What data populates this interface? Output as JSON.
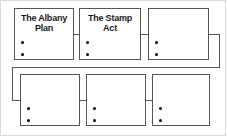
{
  "diagram": {
    "type": "flowchart",
    "title": "",
    "layout": "two-row-serpentine",
    "row_count": 2,
    "nodes_per_row": 3,
    "nodes": [
      {
        "id": "node-1",
        "label": "The Albany Plan",
        "title_line_1": "The Albany",
        "title_line_2": "Plan",
        "bullets": [
          "",
          ""
        ],
        "bullet_count": 2,
        "row": 1,
        "column": 1,
        "filled": true
      },
      {
        "id": "node-2",
        "label": "The Stamp Act",
        "title_line_1": "The Stamp",
        "title_line_2": "Act",
        "bullets": [
          "",
          ""
        ],
        "bullet_count": 2,
        "row": 1,
        "column": 2,
        "filled": true
      },
      {
        "id": "node-3",
        "label": "",
        "title_line_1": "",
        "title_line_2": "",
        "bullets": [
          "",
          ""
        ],
        "bullet_count": 2,
        "row": 1,
        "column": 3,
        "filled": false
      },
      {
        "id": "node-4",
        "label": "",
        "title_line_1": "",
        "title_line_2": "",
        "bullets": [
          "",
          ""
        ],
        "bullet_count": 2,
        "row": 2,
        "column": 1,
        "filled": false
      },
      {
        "id": "node-5",
        "label": "",
        "title_line_1": "",
        "title_line_2": "",
        "bullets": [
          "",
          ""
        ],
        "bullet_count": 2,
        "row": 2,
        "column": 2,
        "filled": false
      },
      {
        "id": "node-6",
        "label": "",
        "title_line_1": "",
        "title_line_2": "",
        "bullets": [
          "",
          ""
        ],
        "bullet_count": 2,
        "row": 2,
        "column": 3,
        "filled": false
      }
    ],
    "connectors": [
      {
        "id": "connector-1-2",
        "from": "node-1",
        "to": "node-2",
        "style": "straight-horizontal"
      },
      {
        "id": "connector-2-3",
        "from": "node-2",
        "to": "node-3",
        "style": "straight-horizontal"
      },
      {
        "id": "connector-3-4",
        "from": "node-3",
        "to": "node-4",
        "style": "wrap-around"
      },
      {
        "id": "connector-4-5",
        "from": "node-4",
        "to": "node-5",
        "style": "straight-horizontal"
      },
      {
        "id": "connector-5-6",
        "from": "node-5",
        "to": "node-6",
        "style": "straight-horizontal"
      }
    ]
  },
  "colors": {
    "node_border": "#555555",
    "node_fill": "#ffffff",
    "bullet": "#000000",
    "connector": "#555555",
    "frame": "#d9d9d9",
    "text": "#1a1a1a",
    "background": "#ffffff"
  }
}
